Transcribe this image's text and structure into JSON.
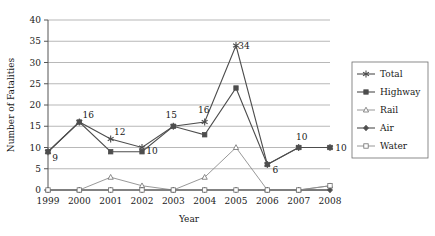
{
  "chart_data": {
    "type": "line",
    "title": "",
    "xlabel": "Year",
    "ylabel": "Number of Fatalities",
    "categories": [
      "1999",
      "2000",
      "2001",
      "2002",
      "2003",
      "2004",
      "2005",
      "2006",
      "2007",
      "2008"
    ],
    "x": [
      1999,
      2000,
      2001,
      2002,
      2003,
      2004,
      2005,
      2006,
      2007,
      2008
    ],
    "ylim": [
      0,
      40
    ],
    "yticks": [
      0,
      5,
      10,
      15,
      20,
      25,
      30,
      35,
      40
    ],
    "ytick_labels": [
      "0",
      "5",
      "10",
      "15",
      "20",
      "25",
      "30",
      "35",
      "40"
    ],
    "grid": true,
    "legend_position": "right",
    "series": [
      {
        "name": "Total",
        "marker": "asterisk",
        "values": [
          9,
          16,
          12,
          10,
          15,
          16,
          34,
          6,
          10,
          10
        ]
      },
      {
        "name": "Highway",
        "marker": "filled-square",
        "values": [
          9,
          16,
          9,
          9,
          15,
          13,
          24,
          6,
          10,
          10
        ]
      },
      {
        "name": "Rail",
        "marker": "triangle",
        "values": [
          0,
          0,
          3,
          1,
          0,
          3,
          10,
          0,
          0,
          1
        ]
      },
      {
        "name": "Air",
        "marker": "filled-diamond",
        "values": [
          0,
          0,
          0,
          0,
          0,
          0,
          0,
          0,
          0,
          0
        ]
      },
      {
        "name": "Water",
        "marker": "open-square",
        "values": [
          0,
          0,
          0,
          0,
          0,
          0,
          0,
          0,
          0,
          1
        ]
      }
    ],
    "data_labels": [
      {
        "text": "9",
        "x": 1999,
        "y": 9,
        "dx": 7,
        "dy": 9
      },
      {
        "text": "16",
        "x": 2000,
        "y": 16,
        "dx": 9,
        "dy": -4
      },
      {
        "text": "12",
        "x": 2001,
        "y": 12,
        "dx": 9,
        "dy": -4
      },
      {
        "text": "10",
        "x": 2002,
        "y": 10,
        "dx": 10,
        "dy": 6
      },
      {
        "text": "15",
        "x": 2003,
        "y": 15,
        "dx": -2,
        "dy": -8
      },
      {
        "text": "16",
        "x": 2004,
        "y": 16,
        "dx": -1,
        "dy": -9
      },
      {
        "text": "34",
        "x": 2005,
        "y": 34,
        "dx": 8,
        "dy": 3
      },
      {
        "text": "6",
        "x": 2006,
        "y": 6,
        "dx": 8,
        "dy": 8
      },
      {
        "text": "10",
        "x": 2007,
        "y": 10,
        "dx": 3,
        "dy": -8
      },
      {
        "text": "10",
        "x": 2008,
        "y": 10,
        "dx": 11,
        "dy": 3
      }
    ]
  },
  "legend": {
    "items": [
      {
        "label": "Total"
      },
      {
        "label": "Highway"
      },
      {
        "label": "Rail"
      },
      {
        "label": "Air"
      },
      {
        "label": "Water"
      }
    ]
  }
}
